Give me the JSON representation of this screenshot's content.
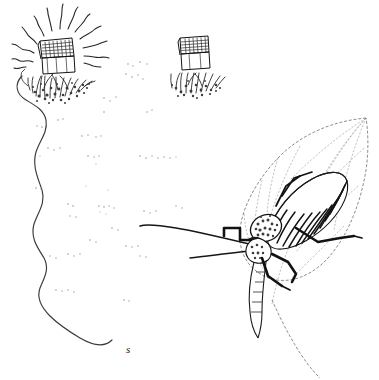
{
  "figure": {
    "background_color": "#ffffff",
    "ink_color": "#1a1a1a",
    "faint_color": "#9a9a9a",
    "width": 379,
    "height": 380
  },
  "labels": [
    {
      "id": "s",
      "text": "s",
      "x": 128,
      "y": 349,
      "style": "italic"
    }
  ],
  "objects": {
    "speaker_box_left": {
      "name": "Speaker trap box (left, calling)",
      "x": 38,
      "y": 33,
      "width": 40,
      "height": 40,
      "emitting_sound": true,
      "sound_ray_count": 11
    },
    "speaker_box_right": {
      "name": "Speaker trap box (centre-right, silent)",
      "x": 178,
      "y": 32,
      "width": 32,
      "height": 33,
      "emitting_sound": false,
      "sound_ray_count": 0
    },
    "vegetation_clump_left": {
      "name": "Grass clump beneath left box",
      "cx": 62,
      "cy": 82
    },
    "vegetation_clump_right": {
      "name": "Grass clump beneath right box",
      "cx": 198,
      "cy": 78
    },
    "walking_track": {
      "name": "Wavy walking track of insect",
      "start_x": 22,
      "start_y": 76,
      "end_x": 130,
      "end_y": 340,
      "label": "s"
    },
    "leaf": {
      "name": "Leaf perch",
      "tip_x": 366,
      "tip_y": 118,
      "base_x": 282,
      "base_y": 300,
      "vein_count": 7,
      "edge_style": "dashed"
    },
    "katydid": {
      "name": "Katydid / bush cricket on leaf",
      "body_x": 258,
      "body_y": 170,
      "body_width": 95,
      "body_height": 100,
      "antenna_length_px": 150,
      "leg_count": 6,
      "wing_stripe_count": 12,
      "facing": "down-left"
    }
  }
}
